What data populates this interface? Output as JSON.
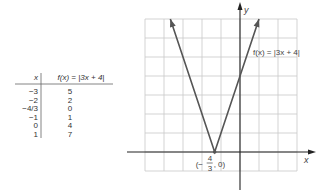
{
  "chart_data": {
    "type": "line",
    "title": "",
    "function_label": "f(x) = |3x + 4|",
    "xlabel": "x",
    "ylabel": "y",
    "xlim": [
      -5,
      3
    ],
    "ylim": [
      -1,
      7
    ],
    "grid": true,
    "grid_step": 1,
    "series": [
      {
        "name": "f(x) = |3x + 4|",
        "points": [
          [
            -3.667,
            7
          ],
          [
            -1.333,
            0
          ],
          [
            1,
            7
          ]
        ],
        "arrows_at_ends": true
      }
    ],
    "annotations": [
      {
        "text": "(−4/3, 0)",
        "x": -1.333,
        "y": 0,
        "display": {
          "open": "(−",
          "num": "4",
          "den": "3",
          "close": ", 0)"
        }
      }
    ],
    "table": {
      "headers": [
        "x",
        "f(x) = |3x + 4|"
      ],
      "rows": [
        [
          "−3",
          "5"
        ],
        [
          "−2",
          "2"
        ],
        [
          "−4/3",
          "0"
        ],
        [
          "−1",
          "1"
        ],
        [
          "0",
          "4"
        ],
        [
          "1",
          "7"
        ]
      ]
    }
  },
  "labels": {
    "x_axis": "x",
    "y_axis": "y",
    "function": "f(x) = |3x + 4|",
    "vertex_open": "(−",
    "vertex_num": "4",
    "vertex_den": "3",
    "vertex_close": ", 0)"
  },
  "table": {
    "header_x": "x",
    "header_f": "f(x) = |3x + 4|",
    "rows": [
      {
        "x": "−3",
        "f": "5"
      },
      {
        "x": "−2",
        "f": "2"
      },
      {
        "x": "−4/3",
        "f": "0"
      },
      {
        "x": "−1",
        "f": "1"
      },
      {
        "x": "0",
        "f": "4"
      },
      {
        "x": "1",
        "f": "7"
      }
    ]
  },
  "colors": {
    "grid": "#c8c8c8",
    "axis": "#222222",
    "curve": "#555555",
    "text": "#444444"
  }
}
